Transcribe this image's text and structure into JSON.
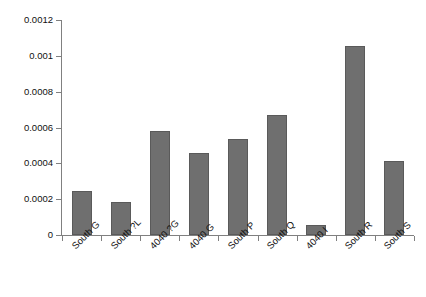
{
  "chart_data": {
    "type": "bar",
    "title": "",
    "subtitle": "",
    "xlabel": "",
    "ylabel": "",
    "categories": [
      "South G",
      "South ?L",
      "4040 ?G",
      "4040 G",
      "South P",
      "South Q",
      "4040 I",
      "South R",
      "South S"
    ],
    "values": [
      0.000245,
      0.000187,
      0.000578,
      0.000455,
      0.000535,
      0.00067,
      5.6e-05,
      0.001055,
      0.000412
    ],
    "ylim": [
      0,
      0.0012
    ],
    "yticks": [
      0,
      0.0002,
      0.0004,
      0.0006,
      0.0008,
      0.001,
      0.0012
    ],
    "ytick_labels": [
      "0",
      "0.0002",
      "0.0004",
      "0.0006",
      "0.0008",
      "0.001",
      "0.0012"
    ],
    "grid": false,
    "legend": false,
    "legend_position": "none",
    "bar_color": "#6f6f6f",
    "bar_edge_color": "#5a5a5a",
    "axis_color": "#808080",
    "background_color": "#ffffff",
    "xtick_label_rotation": -45
  }
}
